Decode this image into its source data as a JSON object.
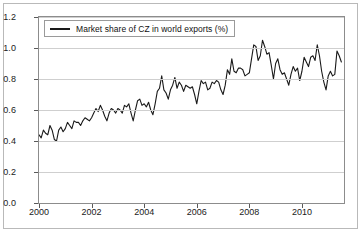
{
  "chart_data": {
    "type": "line",
    "title": "",
    "subtitle": "",
    "xlabel": "",
    "ylabel": "",
    "xlim": [
      2000.0,
      2011.6
    ],
    "ylim": [
      0.0,
      1.2
    ],
    "grid": true,
    "legend_position": "top-left",
    "legend": [
      "Market share of CZ in world exports (%)"
    ],
    "series": [
      {
        "name": "Market share of CZ in world exports (%)",
        "color": "#1a1a1a",
        "x": [
          2000.0,
          2000.083,
          2000.167,
          2000.25,
          2000.333,
          2000.417,
          2000.5,
          2000.583,
          2000.667,
          2000.75,
          2000.833,
          2000.917,
          2001.0,
          2001.083,
          2001.167,
          2001.25,
          2001.333,
          2001.417,
          2001.5,
          2001.583,
          2001.667,
          2001.75,
          2001.833,
          2001.917,
          2002.0,
          2002.083,
          2002.167,
          2002.25,
          2002.333,
          2002.417,
          2002.5,
          2002.583,
          2002.667,
          2002.75,
          2002.833,
          2002.917,
          2003.0,
          2003.083,
          2003.167,
          2003.25,
          2003.333,
          2003.417,
          2003.5,
          2003.583,
          2003.667,
          2003.75,
          2003.833,
          2003.917,
          2004.0,
          2004.083,
          2004.167,
          2004.25,
          2004.333,
          2004.417,
          2004.5,
          2004.583,
          2004.667,
          2004.75,
          2004.833,
          2004.917,
          2005.0,
          2005.083,
          2005.167,
          2005.25,
          2005.333,
          2005.417,
          2005.5,
          2005.583,
          2005.667,
          2005.75,
          2005.833,
          2005.917,
          2006.0,
          2006.083,
          2006.167,
          2006.25,
          2006.333,
          2006.417,
          2006.5,
          2006.583,
          2006.667,
          2006.75,
          2006.833,
          2006.917,
          2007.0,
          2007.083,
          2007.167,
          2007.25,
          2007.333,
          2007.417,
          2007.5,
          2007.583,
          2007.667,
          2007.75,
          2007.833,
          2007.917,
          2008.0,
          2008.083,
          2008.167,
          2008.25,
          2008.333,
          2008.417,
          2008.5,
          2008.583,
          2008.667,
          2008.75,
          2008.833,
          2008.917,
          2009.0,
          2009.083,
          2009.167,
          2009.25,
          2009.333,
          2009.417,
          2009.5,
          2009.583,
          2009.667,
          2009.75,
          2009.833,
          2009.917,
          2010.0,
          2010.083,
          2010.167,
          2010.25,
          2010.333,
          2010.417,
          2010.5,
          2010.583,
          2010.667,
          2010.75,
          2010.833,
          2010.917,
          2011.0,
          2011.083,
          2011.167,
          2011.25,
          2011.333,
          2011.417,
          2011.5
        ],
        "values": [
          0.44,
          0.42,
          0.47,
          0.45,
          0.44,
          0.5,
          0.47,
          0.41,
          0.4,
          0.47,
          0.49,
          0.46,
          0.48,
          0.52,
          0.5,
          0.48,
          0.53,
          0.52,
          0.52,
          0.5,
          0.53,
          0.55,
          0.54,
          0.53,
          0.55,
          0.58,
          0.61,
          0.59,
          0.63,
          0.6,
          0.56,
          0.53,
          0.58,
          0.61,
          0.6,
          0.58,
          0.61,
          0.6,
          0.58,
          0.63,
          0.62,
          0.64,
          0.58,
          0.53,
          0.6,
          0.66,
          0.67,
          0.63,
          0.64,
          0.62,
          0.65,
          0.6,
          0.57,
          0.64,
          0.72,
          0.74,
          0.82,
          0.73,
          0.71,
          0.67,
          0.73,
          0.76,
          0.81,
          0.74,
          0.78,
          0.76,
          0.72,
          0.76,
          0.75,
          0.74,
          0.75,
          0.7,
          0.64,
          0.72,
          0.79,
          0.77,
          0.78,
          0.73,
          0.74,
          0.78,
          0.77,
          0.79,
          0.78,
          0.73,
          0.7,
          0.76,
          0.86,
          0.83,
          0.93,
          0.85,
          0.84,
          0.87,
          0.87,
          0.86,
          0.82,
          0.83,
          0.84,
          0.93,
          1.02,
          1.01,
          0.92,
          0.95,
          1.05,
          1.01,
          0.96,
          0.97,
          0.89,
          0.8,
          0.9,
          0.93,
          0.86,
          0.83,
          0.84,
          0.8,
          0.76,
          0.83,
          0.88,
          0.85,
          0.87,
          0.79,
          0.85,
          0.94,
          0.91,
          0.88,
          0.94,
          0.95,
          0.92,
          1.02,
          0.95,
          0.85,
          0.78,
          0.73,
          0.82,
          0.85,
          0.82,
          0.83,
          0.98,
          0.95,
          0.91
        ]
      }
    ],
    "yticks": [
      "0.0",
      "0.2",
      "0.4",
      "0.6",
      "0.8",
      "1.0",
      "1.2"
    ],
    "ytick_values": [
      0.0,
      0.2,
      0.4,
      0.6,
      0.8,
      1.0,
      1.2
    ],
    "xticks": [
      "2000",
      "2002",
      "2004",
      "2006",
      "2008",
      "2010"
    ],
    "xtick_values": [
      2000,
      2002,
      2004,
      2006,
      2008,
      2010
    ]
  }
}
